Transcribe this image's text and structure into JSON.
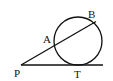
{
  "diagram": {
    "type": "geometry-tangent-secant",
    "circle": {
      "cx": 78,
      "cy": 41,
      "r": 24
    },
    "points": {
      "P": {
        "x": 21,
        "y": 65,
        "label": "P"
      },
      "A": {
        "x": 55,
        "y": 44,
        "label": "A"
      },
      "B": {
        "x": 95,
        "y": 22,
        "label": "B"
      },
      "T": {
        "x": 78,
        "y": 65,
        "label": "T"
      }
    },
    "segments": [
      {
        "name": "secant",
        "from": "P",
        "to": "B"
      },
      {
        "name": "tangent",
        "from": "P",
        "to_x": 103
      }
    ],
    "stroke_color": "#111111",
    "background": "#ffffff"
  }
}
